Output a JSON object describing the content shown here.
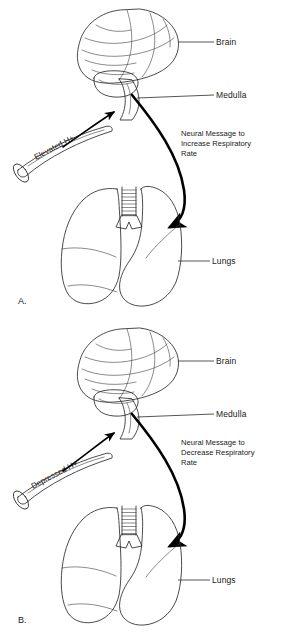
{
  "figure": {
    "panels": [
      {
        "id": "A",
        "panel_label": "A.",
        "stimulus_label": "Elevated H+",
        "message_lines": [
          "Neural Message to",
          "Increase Respiratory",
          "Rate"
        ],
        "callouts": [
          {
            "name": "brain",
            "label": "Brain"
          },
          {
            "name": "medulla",
            "label": "Medulla"
          },
          {
            "name": "lungs",
            "label": "Lungs"
          }
        ]
      },
      {
        "id": "B",
        "panel_label": "B.",
        "stimulus_label": "Depressed H+",
        "message_lines": [
          "Neural Message to",
          "Decrease Respiratory",
          "Rate"
        ],
        "callouts": [
          {
            "name": "brain",
            "label": "Brain"
          },
          {
            "name": "medulla",
            "label": "Medulla"
          },
          {
            "name": "lungs",
            "label": "Lungs"
          }
        ]
      }
    ]
  },
  "colors": {
    "background": "#ffffff",
    "ink": "#1a1a1a",
    "outline": "#2b2b2b",
    "nerve_arrow": "#000000",
    "tissue_fill": "#f3f3f1"
  }
}
